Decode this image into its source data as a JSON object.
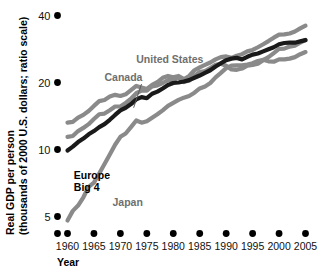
{
  "chart_data": {
    "type": "line",
    "title": "",
    "xlabel": "Year",
    "ylabel_line1": "Real GDP per person",
    "ylabel_line2": "(thousands of 2000 U.S. dollars; ratio scale)",
    "scale": "log",
    "grid": false,
    "legend_position": "inline-annotations",
    "xlim": [
      1958,
      2006
    ],
    "ylim": [
      4.4,
      42
    ],
    "yticks": [
      5,
      10,
      20,
      40
    ],
    "ytick_labels": [
      "5",
      "10",
      "20",
      "40"
    ],
    "xticks": [
      1960,
      1965,
      1970,
      1975,
      1980,
      1985,
      1990,
      1995,
      2000,
      2005
    ],
    "xtick_labels": [
      "1960",
      "1965",
      "1970",
      "1975",
      "1980",
      "1985",
      "1990",
      "1995",
      "2000",
      "2005"
    ],
    "extra_axis_dot_x": 1958,
    "x": [
      1960,
      1961,
      1962,
      1963,
      1964,
      1965,
      1966,
      1967,
      1968,
      1969,
      1970,
      1971,
      1972,
      1973,
      1974,
      1975,
      1976,
      1977,
      1978,
      1979,
      1980,
      1981,
      1982,
      1983,
      1984,
      1985,
      1986,
      1987,
      1988,
      1989,
      1990,
      1991,
      1992,
      1993,
      1994,
      1995,
      1996,
      1997,
      1998,
      1999,
      2000,
      2001,
      2002,
      2003,
      2004,
      2005
    ],
    "series": [
      {
        "name": "United States",
        "color": "#8a8a8a",
        "label_x": 1973,
        "label_y": 24.5,
        "values": [
          13.2,
          13.3,
          13.9,
          14.3,
          14.9,
          15.7,
          16.5,
          16.7,
          17.3,
          17.6,
          17.4,
          17.7,
          18.5,
          19.3,
          19.0,
          18.7,
          19.5,
          20.1,
          21.0,
          21.4,
          21.1,
          21.4,
          20.7,
          21.4,
          22.7,
          23.4,
          24.0,
          24.6,
          25.4,
          26.0,
          26.2,
          25.8,
          26.4,
          26.8,
          27.6,
          28.0,
          28.8,
          29.7,
          30.7,
          31.8,
          32.8,
          32.9,
          33.2,
          33.9,
          35.0,
          36.0
        ]
      },
      {
        "name": "Canada",
        "color": "#8a8a8a",
        "label_x": 1967,
        "label_y": 20.3,
        "leader_to_x": 1972.5,
        "leader_to_y": 15.4,
        "values": [
          11.4,
          11.5,
          12.1,
          12.5,
          13.0,
          13.7,
          14.4,
          14.5,
          15.0,
          15.6,
          15.6,
          16.2,
          16.9,
          17.9,
          18.4,
          18.4,
          19.2,
          19.4,
          19.9,
          20.5,
          20.5,
          21.1,
          20.1,
          20.4,
          21.4,
          22.3,
          22.5,
          23.2,
          24.0,
          24.3,
          23.8,
          22.9,
          22.8,
          23.1,
          23.8,
          24.0,
          24.3,
          25.2,
          26.0,
          27.1,
          28.3,
          28.4,
          29.0,
          29.3,
          30.2,
          31.1
        ]
      },
      {
        "name": "Europe Big 4",
        "color": "#1a1a1a",
        "label_x": 1961.2,
        "label_y": 7.4,
        "label_line2": "Big 4",
        "values": [
          9.9,
          10.3,
          10.8,
          11.2,
          11.7,
          12.1,
          12.6,
          13.0,
          13.6,
          14.3,
          15.0,
          15.4,
          16.0,
          16.8,
          17.2,
          17.0,
          17.8,
          18.2,
          18.8,
          19.5,
          19.9,
          20.0,
          20.2,
          20.5,
          21.0,
          21.5,
          22.1,
          22.7,
          23.6,
          24.4,
          25.2,
          25.6,
          25.8,
          25.4,
          26.1,
          26.7,
          27.0,
          27.6,
          28.2,
          28.8,
          29.7,
          30.1,
          30.2,
          30.2,
          30.6,
          31.0
        ]
      },
      {
        "name": "Japan",
        "color": "#8a8a8a",
        "label_x": 1968.5,
        "label_y": 5.55,
        "values": [
          4.8,
          5.3,
          5.6,
          6.1,
          6.8,
          7.1,
          7.8,
          8.6,
          9.5,
          10.5,
          11.4,
          11.8,
          12.6,
          13.5,
          13.2,
          13.4,
          13.9,
          14.4,
          15.0,
          15.7,
          16.2,
          16.7,
          17.1,
          17.4,
          18.0,
          18.8,
          19.2,
          19.9,
          21.1,
          22.1,
          23.2,
          23.8,
          23.9,
          23.9,
          24.1,
          24.4,
          25.0,
          25.3,
          24.9,
          24.8,
          25.4,
          25.4,
          25.6,
          26.0,
          26.8,
          27.4
        ]
      }
    ]
  }
}
